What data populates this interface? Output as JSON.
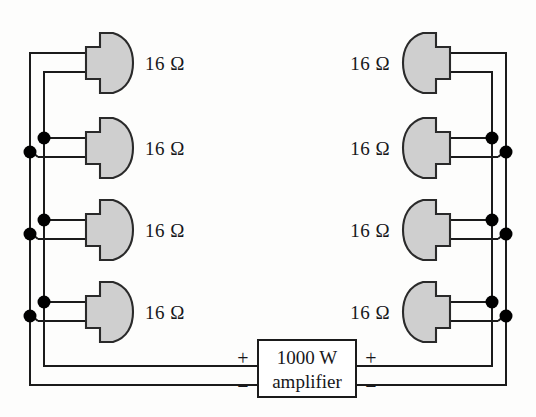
{
  "figure": {
    "background_color": "#fdfdfc",
    "wire_color": "#1b1b1b",
    "speaker_fill": "#cfcfcf",
    "speaker_stroke": "#2a2a2a",
    "junction_color": "#000000"
  },
  "amplifier": {
    "power_label": "1000 W",
    "name_label": "amplifier",
    "left_plus": "+",
    "left_minus": "−",
    "right_plus": "+",
    "right_minus": "−"
  },
  "speakers": {
    "left": [
      {
        "id": "left-speaker-1",
        "label": "16 Ω",
        "impedance": "16",
        "unit": "Ω"
      },
      {
        "id": "left-speaker-2",
        "label": "16 Ω",
        "impedance": "16",
        "unit": "Ω"
      },
      {
        "id": "left-speaker-3",
        "label": "16 Ω",
        "impedance": "16",
        "unit": "Ω"
      },
      {
        "id": "left-speaker-4",
        "label": "16 Ω",
        "impedance": "16",
        "unit": "Ω"
      }
    ],
    "right": [
      {
        "id": "right-speaker-1",
        "label": "16 Ω",
        "impedance": "16",
        "unit": "Ω"
      },
      {
        "id": "right-speaker-2",
        "label": "16 Ω",
        "impedance": "16",
        "unit": "Ω"
      },
      {
        "id": "right-speaker-3",
        "label": "16 Ω",
        "impedance": "16",
        "unit": "Ω"
      },
      {
        "id": "right-speaker-4",
        "label": "16 Ω",
        "impedance": "16",
        "unit": "Ω"
      }
    ]
  },
  "junction_counts": {
    "left": 6,
    "right": 6
  }
}
